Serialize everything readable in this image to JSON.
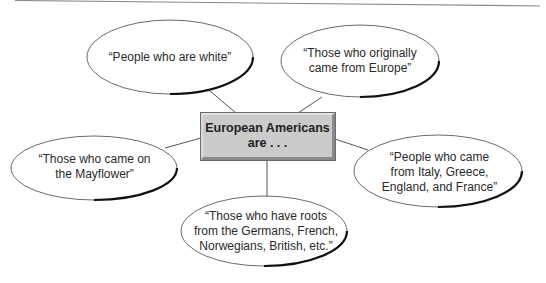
{
  "diagram": {
    "type": "concept-web",
    "center": {
      "line1": "European Americans",
      "line2": "are . . ."
    },
    "nodes": [
      {
        "id": "white",
        "lines": [
          "“People who are white”"
        ]
      },
      {
        "id": "europe",
        "lines": [
          "“Those who originally",
          "came from Europe”"
        ]
      },
      {
        "id": "mayflower",
        "lines": [
          "“Those who came on",
          "the Mayflower”"
        ]
      },
      {
        "id": "countries",
        "lines": [
          "“People who came",
          "from Italy, Greece,",
          "England, and France”"
        ]
      },
      {
        "id": "roots",
        "lines": [
          "“Those who have roots",
          "from the Germans, French,",
          "Norwegians, British, etc.”"
        ]
      }
    ],
    "colors": {
      "box_fill": "#cbcbcb",
      "line": "#555555",
      "ellipse_stroke": "#333333",
      "text": "#2a2a2a"
    }
  }
}
